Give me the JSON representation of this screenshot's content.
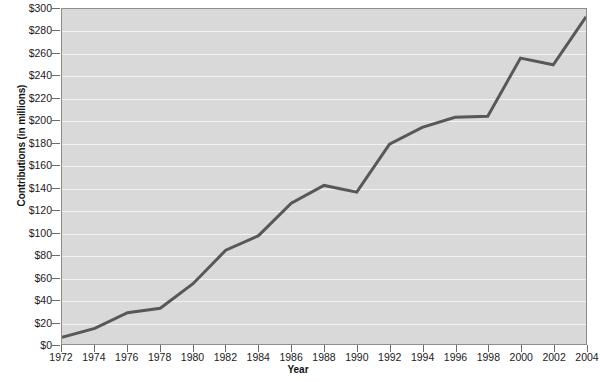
{
  "chart_data": {
    "type": "line",
    "title": "",
    "xlabel": "Year",
    "ylabel": "Contributions (in millions)",
    "x": [
      1972,
      1974,
      1976,
      1978,
      1980,
      1982,
      1984,
      1986,
      1988,
      1990,
      1992,
      1994,
      1996,
      1998,
      2000,
      2002,
      2004
    ],
    "values": [
      6,
      14,
      28,
      32,
      54,
      84,
      97,
      126,
      142,
      136,
      179,
      194,
      203,
      204,
      256,
      250,
      293
    ],
    "series": [
      {
        "name": "Contributions",
        "values": [
          6,
          14,
          28,
          32,
          54,
          84,
          97,
          126,
          142,
          136,
          179,
          194,
          203,
          204,
          256,
          250,
          293
        ]
      }
    ],
    "x_tick_labels": [
      "1972",
      "1974",
      "1976",
      "1978",
      "1980",
      "1982",
      "1984",
      "1986",
      "1988",
      "1990",
      "1992",
      "1994",
      "1996",
      "1998",
      "2000",
      "2002",
      "2004"
    ],
    "y_tick_labels": [
      "$0",
      "$20",
      "$40",
      "$60",
      "$80",
      "$100",
      "$120",
      "$140",
      "$160",
      "$180",
      "$200",
      "$220",
      "$240",
      "$260",
      "$280",
      "$300"
    ],
    "y_tick_values": [
      0,
      20,
      40,
      60,
      80,
      100,
      120,
      140,
      160,
      180,
      200,
      220,
      240,
      260,
      280,
      300
    ],
    "xlim": [
      1972,
      2004
    ],
    "ylim": [
      0,
      300
    ],
    "grid": true,
    "grid_axis": "y",
    "legend": false,
    "legend_position": "none",
    "colors": {
      "line": "#585858",
      "plot_background": "#d9d9d9",
      "gridline": "#f2f2f2",
      "frame": "#8d8d8d",
      "text": "#1a1a1a",
      "page_background": "#ffffff"
    },
    "line_width_px": 3
  }
}
